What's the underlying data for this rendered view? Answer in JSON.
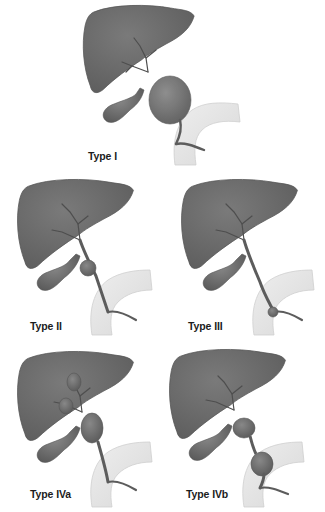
{
  "figure": {
    "colors": {
      "liver": "#6f6f6f",
      "liver_edge": "#555555",
      "duct": "#646464",
      "cyst": "#6a6a6a",
      "duodenum": "#e4e4e4",
      "duodenum_edge": "#cfcfcf",
      "label": "#1c1c1c"
    },
    "panels": [
      {
        "id": "type-i",
        "label": "Type I"
      },
      {
        "id": "type-ii",
        "label": "Type II"
      },
      {
        "id": "type-iii",
        "label": "Type III"
      },
      {
        "id": "type-iva",
        "label": "Type IVa"
      },
      {
        "id": "type-ivb",
        "label": "Type IVb"
      }
    ]
  }
}
